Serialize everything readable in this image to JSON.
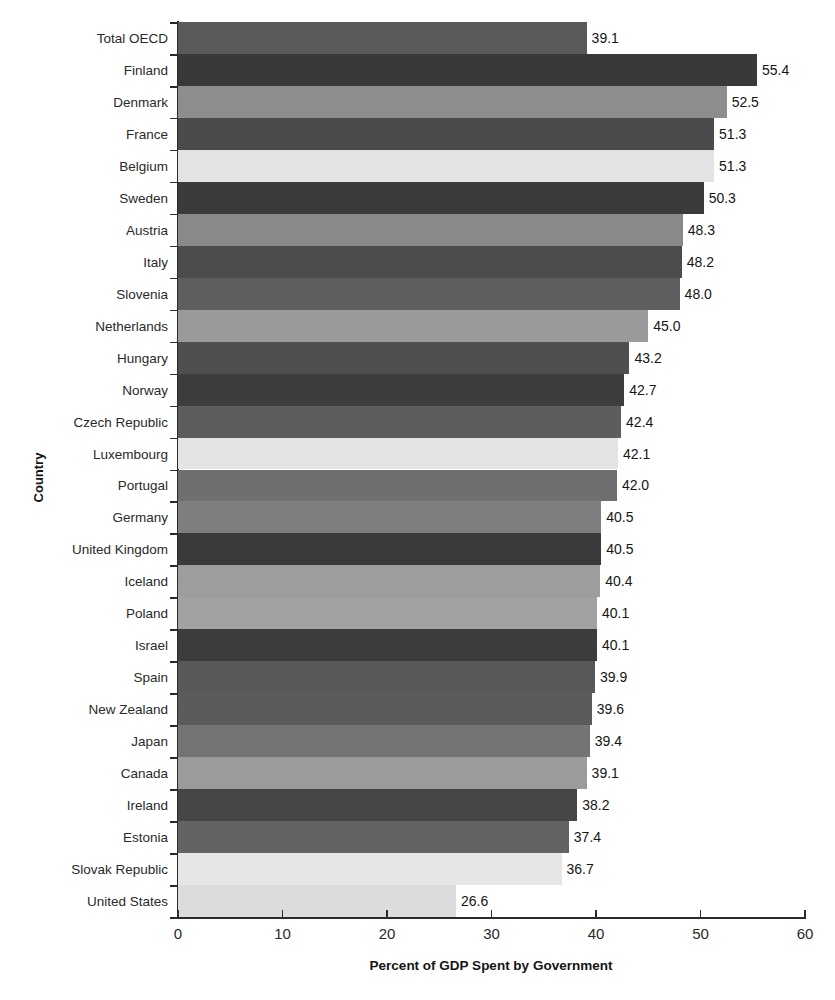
{
  "chart_data": {
    "type": "bar",
    "orientation": "horizontal",
    "title": "",
    "xlabel": "Percent of GDP Spent by Government",
    "ylabel": "Country",
    "xlim": [
      0,
      60
    ],
    "xticks": [
      0,
      10,
      20,
      30,
      40,
      50,
      60
    ],
    "grid": false,
    "legend": "none",
    "categories": [
      "Total OECD",
      "Finland",
      "Denmark",
      "France",
      "Belgium",
      "Sweden",
      "Austria",
      "Italy",
      "Slovenia",
      "Netherlands",
      "Hungary",
      "Norway",
      "Czech Republic",
      "Luxembourg",
      "Portugal",
      "Germany",
      "United Kingdom",
      "Iceland",
      "Poland",
      "Israel",
      "Spain",
      "New Zealand",
      "Japan",
      "Canada",
      "Ireland",
      "Estonia",
      "Slovak Republic",
      "United States"
    ],
    "values": [
      39.1,
      55.4,
      52.5,
      51.3,
      51.3,
      50.3,
      48.3,
      48.2,
      48.0,
      45.0,
      43.2,
      42.7,
      42.4,
      42.1,
      42.0,
      40.5,
      40.5,
      40.4,
      40.1,
      40.1,
      39.9,
      39.6,
      39.4,
      39.1,
      38.2,
      37.4,
      36.7,
      26.6
    ],
    "value_labels": [
      "39.1",
      "55.4",
      "52.5",
      "51.3",
      "51.3",
      "50.3",
      "48.3",
      "48.2",
      "48.0",
      "45.0",
      "43.2",
      "42.7",
      "42.4",
      "42.1",
      "42.0",
      "40.5",
      "40.5",
      "40.4",
      "40.1",
      "40.1",
      "39.9",
      "39.6",
      "39.4",
      "39.1",
      "38.2",
      "37.4",
      "36.7",
      "26.6"
    ],
    "bar_colors": [
      "#5a5a5a",
      "#393939",
      "#8d8d8d",
      "#4b4b4b",
      "#e3e3e3",
      "#3b3b3b",
      "#898989",
      "#4c4c4c",
      "#5e5e5e",
      "#9a9a9a",
      "#4f4f4f",
      "#3d3d3d",
      "#5d5d5d",
      "#e4e4e4",
      "#6f6f6f",
      "#7f7f7f",
      "#3a3a3a",
      "#9d9d9d",
      "#a2a2a2",
      "#3c3c3c",
      "#585858",
      "#5b5b5b",
      "#747474",
      "#9b9b9b",
      "#464646",
      "#636363",
      "#e6e6e6",
      "#dcdcdc"
    ],
    "color_palette_note": "#5a5a5a",
    "axis_color": "#2b2b2b"
  },
  "axes": {
    "x_title": "Percent of GDP Spent by Government",
    "y_title": "Country"
  }
}
